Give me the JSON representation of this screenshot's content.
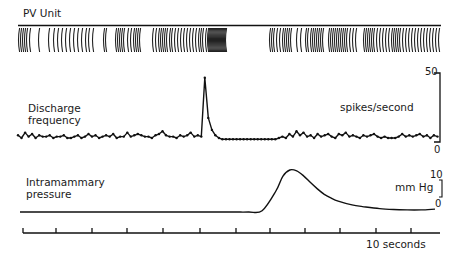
{
  "panels": {
    "unit": {
      "label": "PV Unit"
    },
    "discharge": {
      "label_line1": "Discharge",
      "label_line2": "frequency",
      "units": "spikes/second",
      "scale_max": "50",
      "scale_min": "0"
    },
    "pressure": {
      "label_line1": "Intramammary",
      "label_line2": "pressure",
      "units": "mm Hg",
      "scale_max": "10",
      "scale_min": "0"
    },
    "time": {
      "label": "10 seconds",
      "tick_count": 12
    }
  },
  "colors": {
    "ink": "#111111",
    "background": "#ffffff"
  },
  "chart_data": [
    {
      "type": "raster",
      "title": "PV Unit",
      "description": "Spike train of a single unit; irregular firing with a dense burst just before a short silent period, then resumed firing",
      "x_range_px": [
        18,
        441
      ],
      "spike_x_px": [
        19,
        21,
        23,
        25,
        27,
        30,
        39,
        49,
        54,
        58,
        62,
        66,
        70,
        74,
        78,
        82,
        86,
        89,
        93,
        104,
        106,
        116,
        118,
        120,
        122,
        124,
        128,
        131,
        134,
        136,
        138,
        140,
        153,
        156,
        159,
        161,
        163,
        165,
        167,
        170,
        172,
        175,
        178,
        181,
        184,
        187,
        190,
        193,
        196,
        199,
        201,
        203,
        206,
        208,
        209,
        210,
        211,
        212,
        213,
        214,
        215,
        216,
        217,
        218,
        219,
        220,
        221,
        222,
        223,
        224,
        225,
        226,
        270,
        272,
        274,
        277,
        280,
        283,
        285,
        287,
        289,
        291,
        297,
        301,
        306,
        308,
        311,
        313,
        315,
        317,
        319,
        321,
        323,
        329,
        331,
        333,
        335,
        337,
        339,
        341,
        343,
        345,
        347,
        350,
        353,
        356,
        364,
        366,
        368,
        370,
        372,
        374,
        377,
        380,
        383,
        386,
        389,
        392,
        394,
        396,
        398,
        400,
        403,
        406,
        409,
        412,
        415,
        418,
        421,
        424,
        427,
        430,
        433,
        436,
        439
      ]
    },
    {
      "type": "line",
      "title": "Discharge frequency",
      "ylabel": "spikes/second",
      "ylim": [
        0,
        50
      ],
      "x_unit": "seconds",
      "x": [
        0,
        0.5,
        1,
        1.5,
        2,
        2.5,
        3,
        3.5,
        4,
        4.5,
        5,
        5.5,
        6,
        6.5,
        7,
        7.5,
        8,
        8.5,
        9,
        9.5,
        10,
        10.5,
        11,
        11.5,
        12,
        12.5,
        13,
        13.5,
        14,
        14.5,
        15,
        15.5,
        16,
        16.5,
        17,
        17.5,
        18,
        18.5,
        19,
        19.5,
        20,
        20.5,
        21,
        21.5,
        22,
        22.5,
        23,
        23.5,
        24,
        24.5,
        25,
        25.5,
        26,
        26.5,
        27,
        27.5,
        28,
        28.5,
        29,
        29.5,
        30,
        30.5,
        31,
        31.5,
        32,
        32.5,
        33,
        33.5,
        34,
        34.5,
        35,
        35.5,
        36,
        36.5,
        37,
        37.5,
        38,
        38.5,
        39,
        39.5,
        40,
        40.5,
        41,
        41.5,
        42,
        42.5,
        43,
        43.5,
        44,
        44.5,
        45,
        45.5,
        46,
        46.5,
        47,
        47.5,
        48,
        48.5,
        49,
        49.5,
        50,
        50.5,
        51,
        51.5,
        52,
        52.5,
        53,
        53.5,
        54,
        54.5,
        55,
        55.5,
        56,
        56.5,
        57,
        57.5,
        58,
        58.5,
        59,
        59.5
      ],
      "values": [
        5,
        3,
        7,
        4,
        6,
        3,
        5,
        4,
        4,
        5,
        3,
        4,
        4,
        5,
        3,
        3,
        4,
        5,
        3,
        4,
        6,
        4,
        5,
        3,
        4,
        5,
        4,
        6,
        3,
        4,
        4,
        7,
        4,
        5,
        6,
        5,
        4,
        4,
        3,
        5,
        6,
        8,
        5,
        4,
        4,
        3,
        5,
        4,
        5,
        7,
        4,
        5,
        4,
        48,
        18,
        9,
        5,
        3,
        2,
        2,
        2,
        2,
        2,
        2,
        2,
        2,
        2,
        2,
        2,
        2,
        2,
        2,
        2,
        2,
        3,
        4,
        3,
        6,
        4,
        8,
        5,
        7,
        4,
        5,
        3,
        6,
        4,
        5,
        6,
        4,
        3,
        6,
        5,
        7,
        4,
        5,
        4,
        3,
        5,
        4,
        5,
        6,
        4,
        3,
        4,
        3,
        3,
        3,
        4,
        6,
        4,
        5,
        4,
        5,
        6,
        4,
        5,
        3,
        5,
        4
      ],
      "peak": {
        "x_s": 26.5,
        "value": 48
      }
    },
    {
      "type": "line",
      "title": "Intramammary pressure",
      "ylabel": "mm Hg",
      "ylim": [
        0,
        10
      ],
      "x": [
        0,
        10,
        20,
        30,
        33,
        35,
        37,
        38,
        39,
        40,
        41,
        42,
        43,
        44,
        45,
        46,
        48,
        50,
        52,
        54,
        56,
        58,
        60
      ],
      "values": [
        0,
        0,
        0,
        0,
        0,
        0.3,
        5,
        8.5,
        10,
        9.8,
        8.6,
        7,
        5.5,
        4.2,
        3.3,
        2.6,
        1.7,
        1.2,
        0.8,
        0.6,
        0.5,
        0.5,
        0.7
      ],
      "peak": {
        "x_s": 39,
        "value": 10
      }
    },
    {
      "type": "axis",
      "title": "Time scale",
      "xlabel": "10 seconds",
      "tick_px": [
        23,
        56,
        92,
        127,
        163,
        200,
        236,
        270,
        305,
        340,
        376,
        411
      ]
    }
  ]
}
